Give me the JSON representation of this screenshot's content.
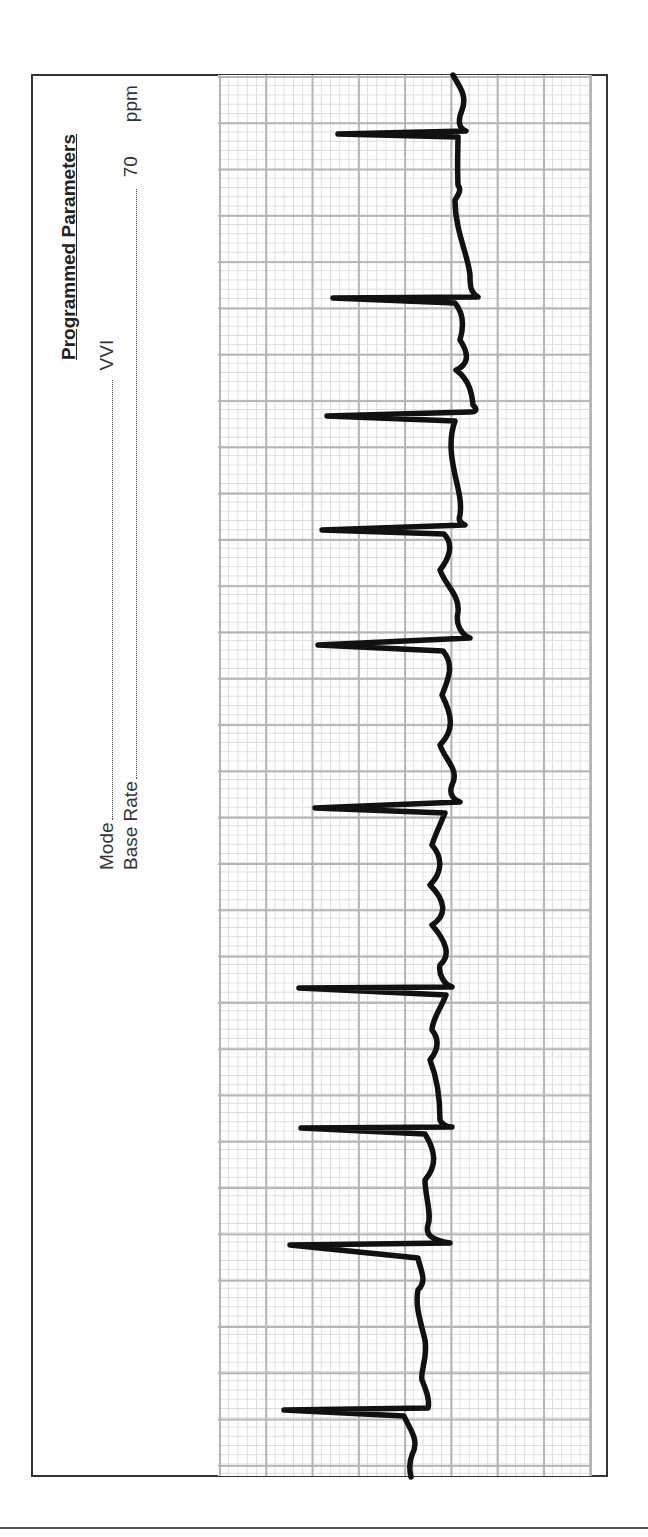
{
  "header": {
    "title": "Programmed Parameters"
  },
  "parameters": [
    {
      "label": "Mode",
      "value": "VVI",
      "unit": ""
    },
    {
      "label": "Base Rate",
      "value": "70",
      "unit": "ppm"
    }
  ],
  "strip": {
    "orientation": "rotated-90-ccw",
    "grid": {
      "major_spacing_px": 46.3,
      "minor_spacing_px": 9.26,
      "major_color": "#b5b5b5",
      "minor_color": "#dcdcdc"
    },
    "trace_color": "#111111",
    "spike_positions_y": [
      134,
      298,
      415,
      528,
      645,
      805,
      990,
      1128,
      1243,
      1410
    ]
  }
}
